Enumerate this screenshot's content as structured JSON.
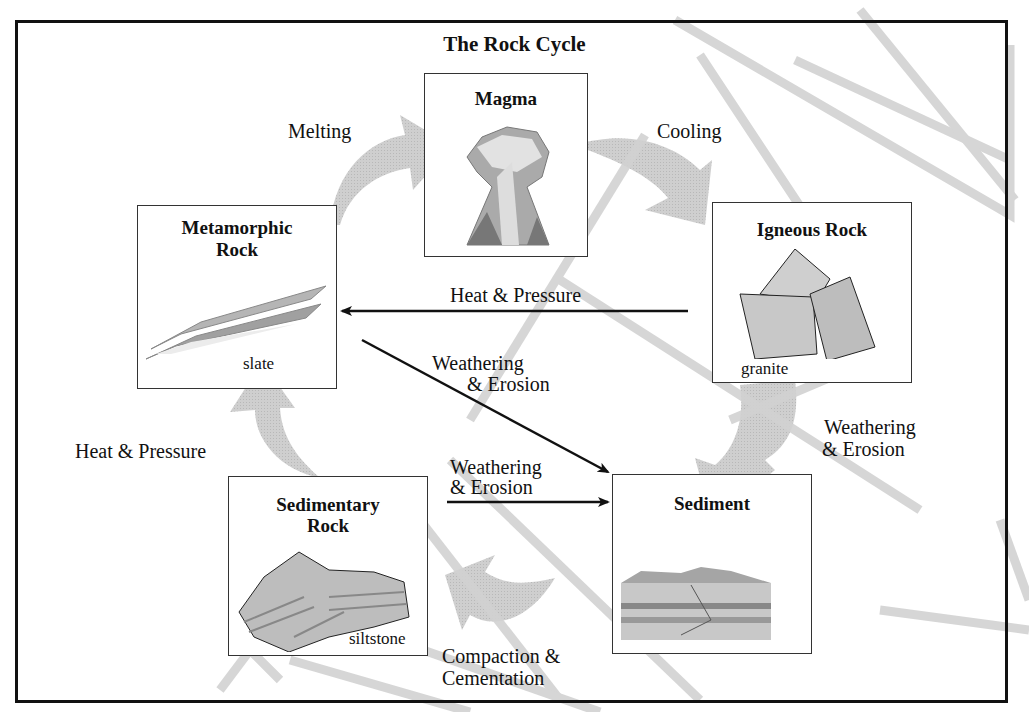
{
  "title": "The Rock Cycle",
  "nodes": {
    "magma": {
      "title": "Magma"
    },
    "metamorphic": {
      "title_line1": "Metamorphic",
      "title_line2": "Rock",
      "caption": "slate"
    },
    "igneous": {
      "title": "Igneous Rock",
      "caption": "granite"
    },
    "sedimentary": {
      "title_line1": "Sedimentary",
      "title_line2": "Rock",
      "caption": "siltstone"
    },
    "sediment": {
      "title": "Sediment"
    }
  },
  "processes": {
    "melting": "Melting",
    "cooling": "Cooling",
    "heat_pressure_top": "Heat & Pressure",
    "heat_pressure_left": "Heat & Pressure",
    "weathering_diag_1": "Weathering",
    "weathering_diag_2": "& Erosion",
    "weathering_right_1": "Weathering",
    "weathering_right_2": "& Erosion",
    "weathering_mid_1": "Weathering",
    "weathering_mid_2": "& Erosion",
    "compaction_1": "Compaction &",
    "compaction_2": "Cementation"
  },
  "colors": {
    "frame": "#111111",
    "cycle_arrow": "#c8c8c8",
    "watermark": "#d0d0d0"
  }
}
